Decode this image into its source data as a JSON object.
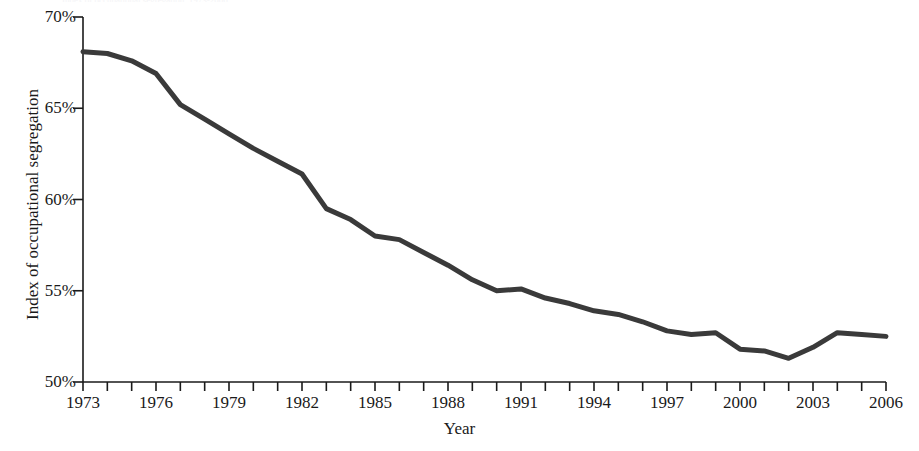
{
  "chart_data": {
    "type": "line",
    "title": "",
    "xlabel": "Year",
    "ylabel": "Index of occupational segregation",
    "xlim": [
      1973,
      2006
    ],
    "ylim": [
      50,
      70
    ],
    "grid": false,
    "legend": null,
    "y_tick_labels": [
      "70%",
      "65%",
      "60%",
      "55%",
      "50%"
    ],
    "y_tick_values": [
      70,
      65,
      60,
      55,
      50
    ],
    "x_tick_labels": [
      "1973",
      "1976",
      "1979",
      "1982",
      "1985",
      "1988",
      "1991",
      "1994",
      "1997",
      "2000",
      "2003",
      "2006"
    ],
    "x_tick_values": [
      1973,
      1976,
      1979,
      1982,
      1985,
      1988,
      1991,
      1994,
      1997,
      2000,
      2003,
      2006
    ],
    "x_minor_ticks": [
      1973,
      1974,
      1975,
      1976,
      1977,
      1978,
      1979,
      1980,
      1981,
      1982,
      1983,
      1984,
      1985,
      1986,
      1987,
      1988,
      1989,
      1990,
      1991,
      1992,
      1993,
      1994,
      1995,
      1996,
      1997,
      1998,
      1999,
      2000,
      2001,
      2002,
      2003,
      2004,
      2005,
      2006
    ],
    "line_color": "#3a3a3a",
    "line_width": 5,
    "axis_color": "#1a1a1a",
    "x": [
      1973,
      1974,
      1975,
      1976,
      1977,
      1978,
      1979,
      1980,
      1981,
      1982,
      1983,
      1984,
      1985,
      1986,
      1987,
      1988,
      1989,
      1990,
      1991,
      1992,
      1993,
      1994,
      1995,
      1996,
      1997,
      1998,
      1999,
      2000,
      2001,
      2002,
      2003,
      2004,
      2005,
      2006
    ],
    "values": [
      68.1,
      68.0,
      67.6,
      66.9,
      65.2,
      64.4,
      63.6,
      62.8,
      62.1,
      61.4,
      59.5,
      58.9,
      58.0,
      57.8,
      57.1,
      56.4,
      55.6,
      55.0,
      55.1,
      54.6,
      54.3,
      53.9,
      53.7,
      53.3,
      52.8,
      52.6,
      52.7,
      51.8,
      51.7,
      51.3,
      51.9,
      52.7,
      52.6,
      52.5
    ],
    "series_name": "Index of occupational segregation"
  },
  "caption": {
    "top_partial": "Index of occupational segregation, 1973-2006"
  }
}
